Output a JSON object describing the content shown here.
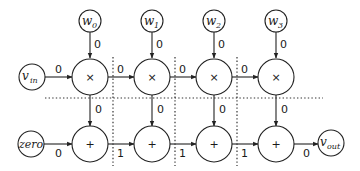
{
  "diagram": {
    "type": "dataflow-graph",
    "inputs": {
      "v_in": {
        "base": "v",
        "sub": "in"
      },
      "zero": {
        "label": "zero"
      },
      "v_out": {
        "base": "v",
        "sub": "out"
      }
    },
    "weights": [
      {
        "base": "w",
        "sub": "0"
      },
      {
        "base": "w",
        "sub": "1"
      },
      {
        "base": "w",
        "sub": "2"
      },
      {
        "base": "w",
        "sub": "3"
      }
    ],
    "multiply_ops": [
      "×",
      "×",
      "×",
      "×"
    ],
    "add_ops": [
      "+",
      "+",
      "+",
      "+"
    ],
    "edge_labels": {
      "weight_to_mult": [
        "0",
        "0",
        "0",
        "0"
      ],
      "vin_to_mult0": "0",
      "mult_chain": [
        "0",
        "0",
        "0"
      ],
      "mult_to_add": [
        "0",
        "0",
        "0",
        "0"
      ],
      "zero_to_add0": "0",
      "add_chain": [
        "1",
        "1",
        "1"
      ],
      "add3_to_vout": "0"
    }
  }
}
